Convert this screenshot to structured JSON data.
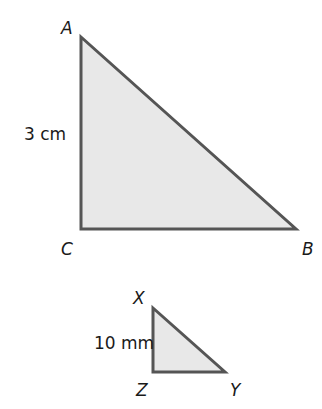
{
  "colors": {
    "fill": "#e8e8e8",
    "stroke": "#555555",
    "text": "#1a1a1a"
  },
  "triangle_large": {
    "name": "ABC",
    "vertices": {
      "A": {
        "label": "A",
        "x": 81,
        "y": 37
      },
      "B": {
        "label": "B",
        "x": 296,
        "y": 229
      },
      "C": {
        "label": "C",
        "x": 81,
        "y": 229
      }
    },
    "side_label": "3 cm",
    "right_angle_at": "C"
  },
  "triangle_small": {
    "name": "XYZ",
    "vertices": {
      "X": {
        "label": "X",
        "x": 153,
        "y": 308
      },
      "Y": {
        "label": "Y",
        "x": 225,
        "y": 372
      },
      "Z": {
        "label": "Z",
        "x": 153,
        "y": 372
      }
    },
    "side_label": "10 mm",
    "right_angle_at": "Z"
  }
}
